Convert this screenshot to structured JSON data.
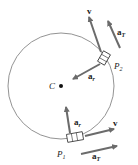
{
  "diagram": {
    "center_label": "C",
    "points": [
      {
        "name": "P",
        "sub": "1"
      },
      {
        "name": "P",
        "sub": "2"
      }
    ],
    "vectors": {
      "velocity": "v",
      "radial_accel": "a",
      "radial_sub": "r",
      "tangential_accel": "a",
      "tangential_sub": "T"
    },
    "colors": {
      "arrow": "#6b6b6b",
      "circle": "#777777",
      "text": "#222222"
    }
  }
}
